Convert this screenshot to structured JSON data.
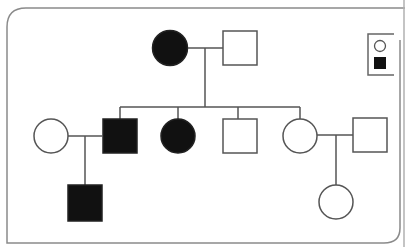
{
  "diagram": {
    "type": "pedigree",
    "colors": {
      "affected": "#111111",
      "unaffected": "#ffffff",
      "stroke": "#555555",
      "border": "#8a8a8a"
    },
    "legend": {
      "items": [
        {
          "symbol": "circle",
          "filled": false
        },
        {
          "symbol": "square",
          "filled": true
        }
      ]
    },
    "generations": [
      {
        "label": "I",
        "individuals": [
          {
            "id": "I-1",
            "sex": "female",
            "affected": true
          },
          {
            "id": "I-2",
            "sex": "male",
            "affected": false
          }
        ]
      },
      {
        "label": "II",
        "individuals": [
          {
            "id": "II-1",
            "sex": "female",
            "affected": false,
            "note": "spouse"
          },
          {
            "id": "II-2",
            "sex": "male",
            "affected": true
          },
          {
            "id": "II-3",
            "sex": "female",
            "affected": true
          },
          {
            "id": "II-4",
            "sex": "male",
            "affected": false
          },
          {
            "id": "II-5",
            "sex": "female",
            "affected": false
          },
          {
            "id": "II-6",
            "sex": "male",
            "affected": false,
            "note": "spouse"
          }
        ]
      },
      {
        "label": "III",
        "individuals": [
          {
            "id": "III-1",
            "sex": "male",
            "affected": true
          },
          {
            "id": "III-2",
            "sex": "female",
            "affected": false
          }
        ]
      }
    ]
  }
}
